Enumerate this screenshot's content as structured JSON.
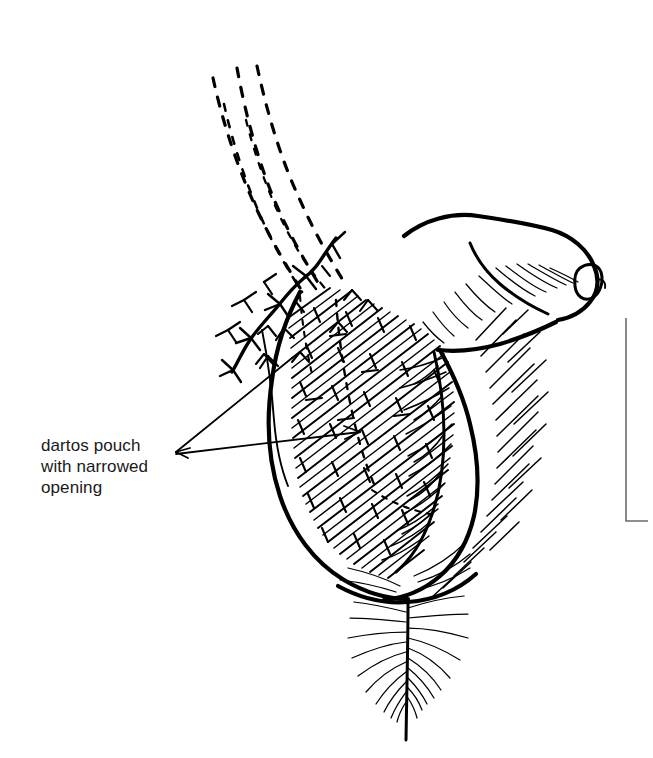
{
  "figure": {
    "domain": "medical-surgical-illustration",
    "title": "Dartos pouch with narrowed opening",
    "background_color": "#ffffff",
    "ink_color": "#000000",
    "canvas": {
      "width": 653,
      "height": 758
    }
  },
  "annotations": [
    {
      "id": "dartos-pouch",
      "text": "dartos pouch\nwith narrowed\nopening",
      "lines": [
        "dartos pouch",
        "with narrowed",
        "opening"
      ],
      "x": 41,
      "y": 435,
      "font_size": 17,
      "color": "#1a1a1a",
      "leader_count": 2
    }
  ],
  "structures": [
    {
      "id": "spermatic-cord",
      "name": "spermatic cord (dashed)",
      "style": "dashed",
      "strand_count": 3
    },
    {
      "id": "suture-line",
      "name": "running suture with knots",
      "style": "solid-with-knots"
    },
    {
      "id": "dartos-pouch",
      "name": "dartos pouch",
      "style": "cross-hatched"
    },
    {
      "id": "glans-penis",
      "name": "glans penis",
      "style": "outline"
    },
    {
      "id": "urethral-meatus",
      "name": "urethral meatus",
      "style": "outline"
    },
    {
      "id": "scrotum-right",
      "name": "right scrotal sac with rugae",
      "style": "outline-with-rugae"
    },
    {
      "id": "scrotal-raphe",
      "name": "scrotal raphe",
      "style": "feathered-line"
    },
    {
      "id": "margin-rule",
      "name": "page margin rule",
      "style": "corner-bracket"
    }
  ],
  "margin_rule": {
    "x": 626,
    "y_top": 318,
    "y_bottom": 521,
    "foot_length": 22,
    "color": "#6b6b6b"
  }
}
